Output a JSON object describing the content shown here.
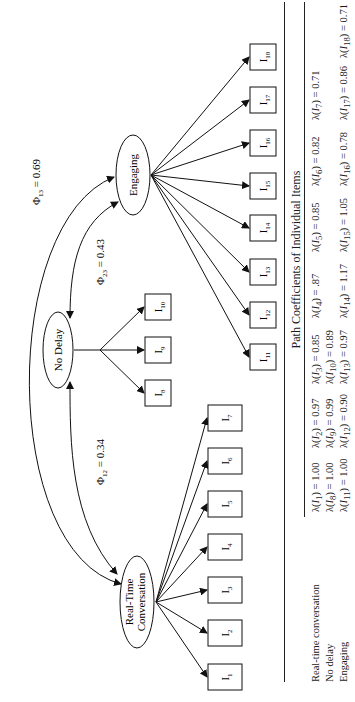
{
  "diagram": {
    "latents": [
      {
        "id": "rtc",
        "label_line1": "Real-Time",
        "label_line2": "Conversation"
      },
      {
        "id": "nd",
        "label": "No Delay"
      },
      {
        "id": "eng",
        "label": "Engaging"
      }
    ],
    "items": [
      {
        "id": "I1",
        "base": "I",
        "sub": "1"
      },
      {
        "id": "I2",
        "base": "I",
        "sub": "2"
      },
      {
        "id": "I3",
        "base": "I",
        "sub": "3"
      },
      {
        "id": "I4",
        "base": "I",
        "sub": "4"
      },
      {
        "id": "I5",
        "base": "I",
        "sub": "5"
      },
      {
        "id": "I6",
        "base": "I",
        "sub": "6"
      },
      {
        "id": "I7",
        "base": "I",
        "sub": "7"
      },
      {
        "id": "I8",
        "base": "I",
        "sub": "8"
      },
      {
        "id": "I9",
        "base": "I",
        "sub": "9"
      },
      {
        "id": "I10",
        "base": "I",
        "sub": "10"
      },
      {
        "id": "I11",
        "base": "I",
        "sub": "11"
      },
      {
        "id": "I12",
        "base": "I",
        "sub": "12"
      },
      {
        "id": "I13",
        "base": "I",
        "sub": "13"
      },
      {
        "id": "I14",
        "base": "I",
        "sub": "14"
      },
      {
        "id": "I15",
        "base": "I",
        "sub": "15"
      },
      {
        "id": "I16",
        "base": "I",
        "sub": "16"
      },
      {
        "id": "I17",
        "base": "I",
        "sub": "17"
      },
      {
        "id": "I18",
        "base": "I",
        "sub": "18"
      }
    ],
    "correlations": [
      {
        "id": "phi12",
        "base": "Φ",
        "sub": "12",
        "value": " = 0.34",
        "between": [
          "Real-Time Conversation",
          "No Delay"
        ]
      },
      {
        "id": "phi23",
        "base": "Φ",
        "sub": "23",
        "value": " = 0.43",
        "between": [
          "No Delay",
          "Engaging"
        ]
      },
      {
        "id": "phi13",
        "base": "Φ",
        "sub": "13",
        "value": " = 0.69",
        "between": [
          "Real-Time Conversation",
          "Engaging"
        ]
      }
    ],
    "loadings_map": {
      "Real-Time Conversation": [
        "I1",
        "I2",
        "I3",
        "I4",
        "I5",
        "I6",
        "I7"
      ],
      "No Delay": [
        "I8",
        "I9",
        "I10"
      ],
      "Engaging": [
        "I11",
        "I12",
        "I13",
        "I14",
        "I15",
        "I16",
        "I17",
        "I18"
      ]
    }
  },
  "table": {
    "title": "Path Coefficients of Individual Items",
    "rows": [
      {
        "label": "Real-time conversation",
        "cells": [
          {
            "sub": "1",
            "value": " = 1.00"
          },
          {
            "sub": "2",
            "value": " = 0.97"
          },
          {
            "sub": "3",
            "value": " = 0.85"
          },
          {
            "sub": "4",
            "value": " = .87"
          },
          {
            "sub": "5",
            "value": " = 0.85"
          },
          {
            "sub": "6",
            "value": " = 0.82"
          },
          {
            "sub": "7",
            "value": " = 0.71"
          }
        ]
      },
      {
        "label": "No delay",
        "cells": [
          {
            "sub": "8",
            "value": " = 1.00"
          },
          {
            "sub": "9",
            "value": " = 0.99"
          },
          {
            "sub": "10",
            "value": " = 0.89"
          }
        ]
      },
      {
        "label": "Engaging",
        "cells": [
          {
            "sub": "11",
            "value": " = 1.00"
          },
          {
            "sub": "12",
            "value": " = 0.90"
          },
          {
            "sub": "13",
            "value": " = 0.97"
          },
          {
            "sub": "14",
            "value": " = 1.17"
          },
          {
            "sub": "15",
            "value": " = 1.05"
          },
          {
            "sub": "16",
            "value": " = 0.78"
          },
          {
            "sub": "17",
            "value": " = 0.86"
          },
          {
            "sub": "18",
            "value": " = 0.71"
          }
        ]
      }
    ],
    "cell_prefix": "λ(",
    "cell_var": "I",
    "cell_close": ")"
  }
}
